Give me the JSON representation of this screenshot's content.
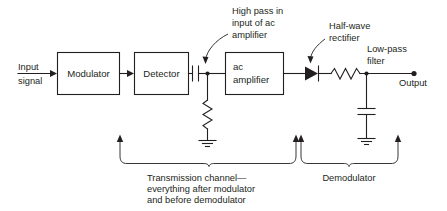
{
  "diagram": {
    "colors": {
      "ink": "#231f20",
      "background": "#ffffff"
    },
    "input": {
      "label_line1": "Input",
      "label_line2": "signal"
    },
    "blocks": [
      {
        "id": "modulator",
        "label": "Modulator"
      },
      {
        "id": "detector",
        "label": "Detector"
      },
      {
        "id": "ac-amplifier",
        "label_line1": "ac",
        "label_line2": "amplifier"
      }
    ],
    "annotations": [
      {
        "id": "high-pass",
        "line1": "High pass in",
        "line2": "input of ac",
        "line3": "amplifier"
      },
      {
        "id": "half-wave-rectifier",
        "line1": "Half-wave",
        "line2": "rectifier"
      },
      {
        "id": "low-pass-filter",
        "line1": "Low-pass",
        "line2": "filter"
      }
    ],
    "output": {
      "label": "Output"
    },
    "brackets": [
      {
        "id": "transmission-channel",
        "line1": "Transmission channel—",
        "line2": "everything after modulator",
        "line3": "and before demodulator"
      },
      {
        "id": "demodulator",
        "line1": "Demodulator"
      }
    ],
    "components": [
      {
        "id": "series-capacitor",
        "type": "capacitor"
      },
      {
        "id": "shunt-resistor",
        "type": "resistor"
      },
      {
        "id": "ground-left",
        "type": "ground"
      },
      {
        "id": "diode",
        "type": "diode"
      },
      {
        "id": "series-resistor",
        "type": "resistor"
      },
      {
        "id": "shunt-capacitor",
        "type": "capacitor"
      },
      {
        "id": "ground-right",
        "type": "ground"
      },
      {
        "id": "output-terminal",
        "type": "terminal-dot"
      }
    ]
  }
}
